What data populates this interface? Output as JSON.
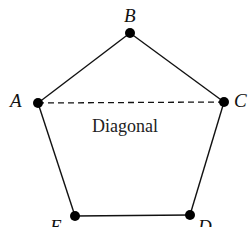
{
  "diagram": {
    "vertices": [
      {
        "name": "A",
        "x": 38,
        "y": 103
      },
      {
        "name": "B",
        "x": 130,
        "y": 33
      },
      {
        "name": "C",
        "x": 224,
        "y": 102
      },
      {
        "name": "D",
        "x": 190,
        "y": 215
      },
      {
        "name": "E",
        "x": 75,
        "y": 216
      }
    ],
    "labels": {
      "A": "A",
      "B": "B",
      "C": "C",
      "D": "D",
      "E": "E"
    },
    "diagonal": {
      "from": "A",
      "to": "C",
      "style": "dashed",
      "label": "Diagonal"
    }
  }
}
